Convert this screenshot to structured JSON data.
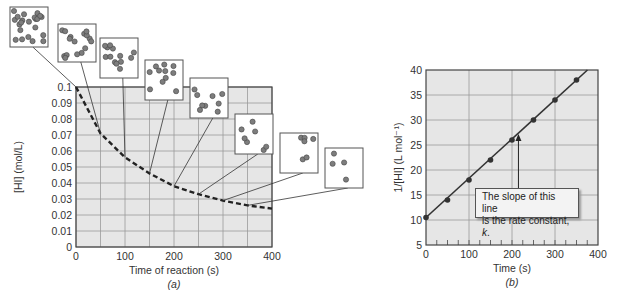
{
  "chart_data": [
    {
      "type": "line",
      "panel_label": "(a)",
      "title": "",
      "xlabel": "Time of reaction (s)",
      "ylabel": "[HI] (mol/L)",
      "xlim": [
        0,
        400
      ],
      "ylim": [
        0,
        0.1
      ],
      "x_ticks": [
        "0",
        "100",
        "200",
        "300",
        "400"
      ],
      "y_ticks": [
        "0",
        "0.01",
        "0.02",
        "0.03",
        "0.04",
        "0.05",
        "0.06",
        "0.07",
        "0.08",
        "0.09",
        "0.1"
      ],
      "grid": true,
      "line_style": "dashed",
      "series": [
        {
          "name": "[HI]",
          "x": [
            0,
            50,
            100,
            150,
            200,
            250,
            300,
            350,
            400
          ],
          "values": [
            0.1,
            0.071,
            0.056,
            0.046,
            0.038,
            0.033,
            0.029,
            0.026,
            0.024
          ]
        }
      ],
      "annotations": "Molecular-view insets (boxes of HI molecules) linked to points at t = 0, 50, 100, 150, 200, 250, 300, 350 s showing decreasing number of molecules"
    },
    {
      "type": "line",
      "panel_label": "(b)",
      "title": "",
      "xlabel": "Time (s)",
      "ylabel": "1/[HI] (L mol⁻¹)",
      "xlim": [
        0,
        400
      ],
      "ylim": [
        5,
        40
      ],
      "x_ticks": [
        "0",
        "100",
        "200",
        "300",
        "400"
      ],
      "y_ticks": [
        "5",
        "10",
        "15",
        "20",
        "25",
        "30",
        "35",
        "40"
      ],
      "grid": true,
      "series": [
        {
          "name": "1/[HI]",
          "x": [
            0,
            50,
            100,
            150,
            200,
            250,
            300,
            350
          ],
          "values": [
            10.5,
            14,
            18,
            22,
            26,
            30,
            34,
            38
          ]
        }
      ],
      "annotations": "The slope of this line is the rate constant, k."
    }
  ],
  "callout": {
    "line1": "The slope of this line",
    "line2_prefix": "is the rate constant, ",
    "line2_k": "k",
    "line2_suffix": "."
  }
}
